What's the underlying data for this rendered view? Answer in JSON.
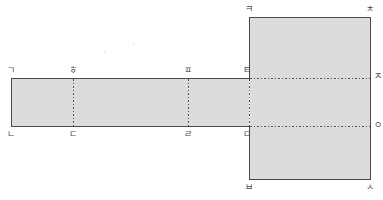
{
  "figure": {
    "colors": {
      "fill": "#dcdcdc",
      "stroke": "#4a4a4a",
      "dotted": "#555555",
      "label": "#4a4a4a",
      "background": "#ffffff"
    },
    "strip": {
      "name": "horizontal-strip",
      "x": 11,
      "y": 78,
      "width": 238,
      "height": 49
    },
    "panel": {
      "name": "vertical-panel",
      "x": 249,
      "y": 17,
      "width": 122,
      "height": 163
    },
    "dashed_vertical_lines": [
      {
        "name": "fold-line-heung-digeut",
        "x": 73,
        "y1": 78,
        "y2": 127
      },
      {
        "name": "fold-line-pieup-rieul",
        "x": 188,
        "y1": 78,
        "y2": 127
      }
    ],
    "dashed_horizontal_lines": [
      {
        "name": "fold-line-tieut-jieut",
        "y": 78,
        "x1": 249,
        "x2": 371
      },
      {
        "name": "fold-line-mieum-ieung",
        "y": 127,
        "x1": 249,
        "x2": 371
      }
    ],
    "labels": [
      {
        "id": "giyeok",
        "text": "ㄱ",
        "x": 7,
        "y": 66,
        "anchor": "top-left-of-strip"
      },
      {
        "id": "hieut",
        "text": "ㅎ",
        "x": 69,
        "y": 66,
        "anchor": "top-fold-1"
      },
      {
        "id": "pieup",
        "text": "ㅍ",
        "x": 184,
        "y": 66,
        "anchor": "top-fold-2"
      },
      {
        "id": "tieut",
        "text": "ㅌ",
        "x": 243,
        "y": 66,
        "anchor": "top-right-of-strip"
      },
      {
        "id": "nieun",
        "text": "ㄴ",
        "x": 7,
        "y": 130,
        "anchor": "bottom-left-of-strip"
      },
      {
        "id": "digeut",
        "text": "ㄷ",
        "x": 69,
        "y": 130,
        "anchor": "bottom-fold-1"
      },
      {
        "id": "rieul",
        "text": "ㄹ",
        "x": 184,
        "y": 130,
        "anchor": "bottom-fold-2"
      },
      {
        "id": "mieum",
        "text": "ㅁ",
        "x": 243,
        "y": 130,
        "anchor": "bottom-right-of-strip"
      },
      {
        "id": "kieuk",
        "text": "ㅋ",
        "x": 245,
        "y": 5,
        "anchor": "top-left-of-panel"
      },
      {
        "id": "chieut",
        "text": "ㅊ",
        "x": 366,
        "y": 5,
        "anchor": "top-right-of-panel"
      },
      {
        "id": "jieut",
        "text": "ㅈ",
        "x": 374,
        "y": 72,
        "anchor": "right-fold-upper"
      },
      {
        "id": "ieung",
        "text": "ㅇ",
        "x": 374,
        "y": 121,
        "anchor": "right-fold-lower"
      },
      {
        "id": "bieup",
        "text": "ㅂ",
        "x": 245,
        "y": 183,
        "anchor": "bottom-left-of-panel"
      },
      {
        "id": "siot",
        "text": "ㅅ",
        "x": 366,
        "y": 183,
        "anchor": "bottom-right-of-panel"
      }
    ],
    "specks": [
      {
        "x": 104,
        "y": 52
      },
      {
        "x": 133,
        "y": 44
      },
      {
        "x": 121,
        "y": 106
      },
      {
        "x": 208,
        "y": 97
      }
    ]
  }
}
